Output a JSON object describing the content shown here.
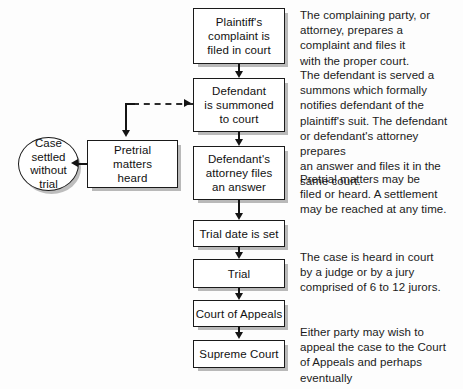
{
  "diagram": {
    "background_color": "#fdfdfd",
    "line_color": "#141414",
    "box_fill": "#ffffff",
    "shadow_color": "#b9b9b9"
  },
  "nodes": [
    {
      "id": "plaintiff-complaint",
      "label": "Plaintiff's\ncomplaint is\nfiled in court",
      "shape": "rectangle"
    },
    {
      "id": "defendant-summoned",
      "label": "Defendant\nis summoned\nto court",
      "shape": "rectangle"
    },
    {
      "id": "defendant-answer",
      "label": "Defendant's\nattorney files\nan answer",
      "shape": "rectangle"
    },
    {
      "id": "trial-date-set",
      "label": "Trial date is set",
      "shape": "rectangle"
    },
    {
      "id": "trial",
      "label": "Trial",
      "shape": "rectangle"
    },
    {
      "id": "court-of-appeals",
      "label": "Court of Appeals",
      "shape": "rectangle"
    },
    {
      "id": "supreme-court",
      "label": "Supreme Court",
      "shape": "rectangle"
    },
    {
      "id": "pretrial-matters",
      "label": "Pretrial\nmatters\nheard",
      "shape": "rectangle"
    },
    {
      "id": "case-settled",
      "label": "Case\nsettled\nwithout\ntrial",
      "shape": "ellipse"
    }
  ],
  "notes": [
    {
      "id": "note-complaint",
      "text": "The complaining party, or\nattorney, prepares a\ncomplaint and files it\nwith the proper court."
    },
    {
      "id": "note-summons",
      "text": "The defendant is served a\nsummons which formally\nnotifies defendant of the\nplaintiff's suit. The defendant\nor defendant's attorney prepares\nan answer and files it in the\nsame court."
    },
    {
      "id": "note-pretrial",
      "text": "Pretrial matters may be\nfiled or heard. A settlement\nmay be reached at any time."
    },
    {
      "id": "note-trial",
      "text": "The case is heard in court\nby a judge or by a jury\ncomprised of 6 to 12 jurors."
    },
    {
      "id": "note-appeals",
      "text": "Either party may wish to\nappeal the case to the Court\nof Appeals and perhaps eventually\nto the Supreme Court."
    }
  ],
  "connectors": [
    {
      "id": "complaint-to-summons",
      "style": "solid",
      "direction": "down"
    },
    {
      "id": "summons-to-answer",
      "style": "solid",
      "direction": "down"
    },
    {
      "id": "answer-to-trial-date",
      "style": "solid",
      "direction": "down"
    },
    {
      "id": "trial-date-to-trial",
      "style": "solid",
      "direction": "down"
    },
    {
      "id": "trial-to-appeals",
      "style": "solid",
      "direction": "down"
    },
    {
      "id": "appeals-to-supreme",
      "style": "solid",
      "direction": "down"
    },
    {
      "id": "summons-to-pretrial",
      "style": "dashed",
      "direction": "left-then-down"
    },
    {
      "id": "pretrial-to-settled",
      "style": "solid",
      "direction": "left"
    }
  ]
}
